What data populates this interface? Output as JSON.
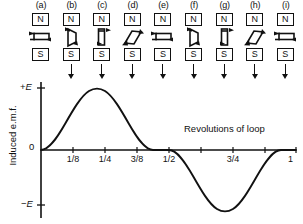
{
  "panels": [
    {
      "label": "(a)",
      "north": "N",
      "south": "S",
      "loop_orientation": "horizontal-flat",
      "has_field_arrow": false
    },
    {
      "label": "(b)",
      "north": "N",
      "south": "S",
      "loop_orientation": "tilted-steep",
      "has_field_arrow": true
    },
    {
      "label": "(c)",
      "north": "N",
      "south": "S",
      "loop_orientation": "vertical-edge",
      "has_field_arrow": true
    },
    {
      "label": "(d)",
      "north": "N",
      "south": "S",
      "loop_orientation": "diagonal",
      "has_field_arrow": true
    },
    {
      "label": "(e)",
      "north": "N",
      "south": "S",
      "loop_orientation": "horizontal-flat",
      "has_field_arrow": true
    },
    {
      "label": "(f)",
      "north": "N",
      "south": "S",
      "loop_orientation": "tilted-steep",
      "has_field_arrow": true
    },
    {
      "label": "(g)",
      "north": "N",
      "south": "S",
      "loop_orientation": "vertical-edge",
      "has_field_arrow": true
    },
    {
      "label": "(h)",
      "north": "N",
      "south": "S",
      "loop_orientation": "diagonal",
      "has_field_arrow": true
    },
    {
      "label": "(i)",
      "north": "N",
      "south": "S",
      "loop_orientation": "horizontal-flat",
      "has_field_arrow": true
    }
  ],
  "graph": {
    "ylabel": "Induced e.m.f.",
    "xlabel": "Revolutions of loop",
    "y_top_label": "+E",
    "y_zero_label": "0",
    "y_bottom_label": "-E",
    "tick_labels": [
      "1/8",
      "1/4",
      "3/8",
      "1/2",
      "3/4",
      "1"
    ],
    "tick_label_values": [
      0.125,
      0.25,
      0.375,
      0.5,
      0.75,
      1.0
    ]
  },
  "chart_data": {
    "type": "line",
    "title": "",
    "xlabel": "Revolutions of loop",
    "ylabel": "Induced e.m.f.",
    "xlim": [
      0,
      1
    ],
    "ylim": [
      -1,
      1
    ],
    "grid": false,
    "legend": "none",
    "x_ticks": [
      0.125,
      0.25,
      0.375,
      0.5,
      0.625,
      0.75,
      0.875,
      1.0
    ],
    "x_tick_labels": [
      "1/8",
      "1/4",
      "3/8",
      "1/2",
      "",
      "3/4",
      "",
      "1"
    ],
    "y_ticks": [
      -1,
      0,
      1
    ],
    "y_tick_labels": [
      "-E",
      "0",
      "+E"
    ],
    "series": [
      {
        "name": "Induced e.m.f.",
        "function": "sin(2*pi*x)",
        "x": [
          0,
          0.0625,
          0.125,
          0.1875,
          0.25,
          0.3125,
          0.375,
          0.4375,
          0.5,
          0.5625,
          0.625,
          0.6875,
          0.75,
          0.8125,
          0.875,
          0.9375,
          1.0
        ],
        "values": [
          0,
          0.383,
          0.707,
          0.924,
          1.0,
          0.924,
          0.707,
          0.383,
          0,
          -0.383,
          -0.707,
          -0.924,
          -1.0,
          -0.924,
          -0.707,
          -0.383,
          0
        ]
      }
    ],
    "annotations": [
      {
        "text": "peak +E at 1/4 revolution",
        "x": 0.25,
        "y": 1.0
      },
      {
        "text": "zero at 1/2 revolution",
        "x": 0.5,
        "y": 0
      },
      {
        "text": "trough -E at 3/4 revolution",
        "x": 0.75,
        "y": -1.0
      }
    ]
  }
}
